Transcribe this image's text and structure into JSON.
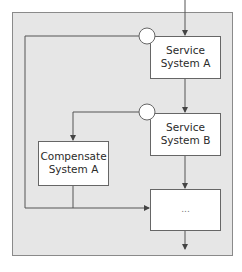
{
  "diagram": {
    "type": "flow",
    "colors": {
      "frame_fill": "#e6e6e6",
      "frame_stroke": "#8a8a8a",
      "box_fill": "#ffffff",
      "line": "#555555"
    },
    "nodes": [
      {
        "id": "service_a",
        "line1": "Service",
        "line2": "System A"
      },
      {
        "id": "service_b",
        "line1": "Service",
        "line2": "System B"
      },
      {
        "id": "compensate_a",
        "line1": "Compensate",
        "line2": "System A"
      },
      {
        "id": "continuation",
        "label": "..."
      }
    ],
    "events": [
      {
        "id": "event_a",
        "shape": "circle",
        "attached_to": "service_a"
      },
      {
        "id": "event_b",
        "shape": "circle",
        "attached_to": "service_b"
      }
    ],
    "edges": [
      {
        "from": "start",
        "to": "service_a"
      },
      {
        "from": "service_a",
        "to": "service_b"
      },
      {
        "from": "service_b",
        "to": "continuation"
      },
      {
        "from": "event_a",
        "to": "continuation"
      },
      {
        "from": "event_b",
        "to": "compensate_a"
      },
      {
        "from": "compensate_a",
        "to": "continuation"
      },
      {
        "from": "continuation",
        "to": "end"
      }
    ]
  }
}
